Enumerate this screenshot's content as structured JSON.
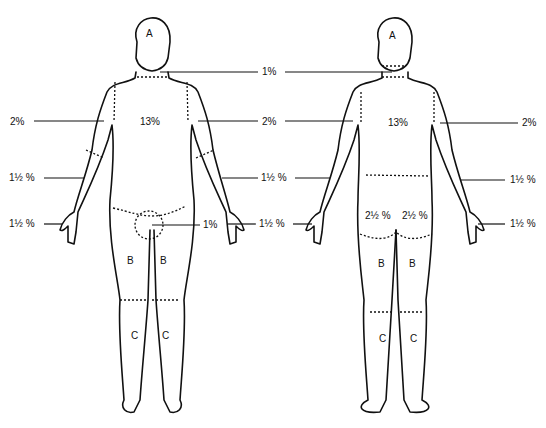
{
  "diagram": {
    "front": {
      "head": "A",
      "trunk": "13%",
      "neck": "1%",
      "upper_arm_left": "2%",
      "upper_arm_right": "2%",
      "forearm_left": "1½ %",
      "forearm_right": "1½ %",
      "hand_left": "1½ %",
      "hand_right": "1½ %",
      "genitalia": "1%",
      "thigh_left": "B",
      "thigh_right": "B",
      "leg_left": "C",
      "leg_right": "C"
    },
    "back": {
      "head": "A",
      "trunk": "13%",
      "upper_arm_right": "2%",
      "forearm_right": "1½ %",
      "hand_right": "1½ %",
      "buttock_left": "2½ %",
      "buttock_right": "2½ %",
      "thigh_left": "B",
      "thigh_right": "B",
      "leg_left": "C",
      "leg_right": "C"
    }
  }
}
